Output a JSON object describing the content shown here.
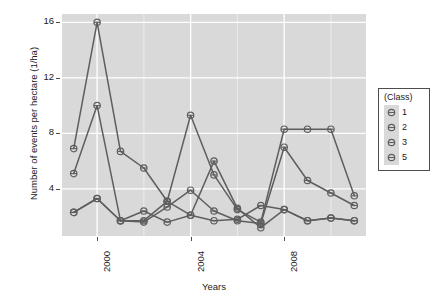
{
  "chart_data": {
    "type": "line",
    "title": "",
    "subtitle": "",
    "xlabel": "Years",
    "ylabel": "Number of events per hectare (1/ha)",
    "x": [
      1999,
      2000,
      2001,
      2002,
      2003,
      2004,
      2005,
      2006,
      2007,
      2008,
      2009,
      2010,
      2011
    ],
    "xlim": [
      1998.5,
      2011.5
    ],
    "ylim": [
      0.6,
      16.6
    ],
    "xticks": [
      2000,
      2004,
      2008
    ],
    "xtick_labels": [
      "2000",
      "2004",
      "2008"
    ],
    "yticks": [
      4,
      8,
      12,
      16
    ],
    "ytick_labels": [
      "4",
      "8",
      "12",
      "16"
    ],
    "grid": true,
    "grid_major_color": "#ffffff",
    "grid_minor_color": "#ececec",
    "panel_background": "#d9d9d9",
    "legend_position": "right",
    "legend_title": "(Class)",
    "series": [
      {
        "name": "1",
        "color": "#5e5e5e",
        "values": [
          6.9,
          16.0,
          6.7,
          5.5,
          3.1,
          9.3,
          5.0,
          2.5,
          1.6,
          8.3,
          8.3,
          8.3,
          3.5
        ]
      },
      {
        "name": "2",
        "color": "#5e5e5e",
        "values": [
          5.1,
          10.0,
          1.7,
          1.6,
          2.7,
          3.9,
          2.4,
          1.7,
          1.5,
          7.0,
          4.6,
          3.7,
          2.8
        ]
      },
      {
        "name": "3",
        "color": "#5e5e5e",
        "values": [
          2.3,
          3.3,
          1.7,
          2.4,
          1.6,
          2.1,
          1.7,
          1.8,
          2.8,
          2.5,
          1.7,
          1.9,
          1.7
        ]
      },
      {
        "name": "5",
        "color": "#5e5e5e",
        "values": [
          2.3,
          3.3,
          1.7,
          1.7,
          3.1,
          2.1,
          6.0,
          2.6,
          1.2,
          2.5,
          1.7,
          1.9,
          1.7
        ]
      }
    ]
  },
  "legend": {
    "title": "(Class)",
    "items": [
      {
        "label": "1"
      },
      {
        "label": "2"
      },
      {
        "label": "3"
      },
      {
        "label": "5"
      }
    ]
  },
  "axes": {
    "y_title": "Number of events per hectare (1/ha)",
    "x_title": "Years",
    "y_labels": [
      "16",
      "12",
      "8",
      "4"
    ],
    "x_labels": [
      "2000",
      "2004",
      "2008"
    ]
  }
}
